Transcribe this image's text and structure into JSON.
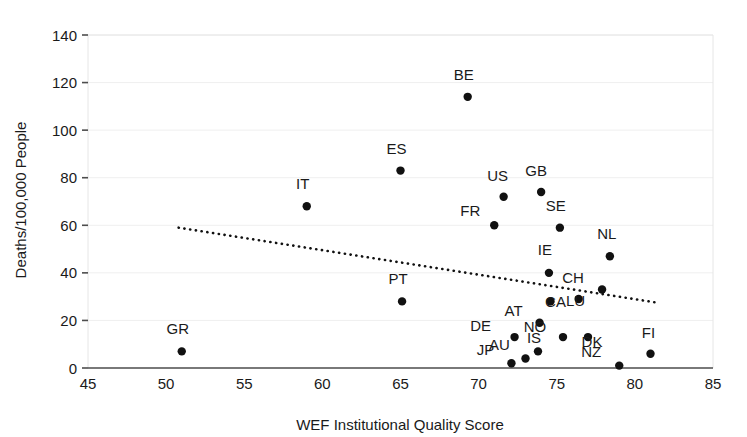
{
  "chart_data": {
    "type": "scatter",
    "title": "",
    "xlabel": "WEF Institutional Quality Score",
    "ylabel": "Deaths/100,000 People",
    "xlim": [
      45,
      85
    ],
    "ylim": [
      0,
      140
    ],
    "xticks": [
      45,
      50,
      55,
      60,
      65,
      70,
      75,
      80,
      85
    ],
    "yticks": [
      0,
      20,
      40,
      60,
      80,
      100,
      120,
      140
    ],
    "grid": "horizontal",
    "legend": "none",
    "marker_color": "#111111",
    "points": [
      {
        "label": "GR",
        "x": 51.0,
        "y": 7,
        "label_dx": -4,
        "label_dy": -17
      },
      {
        "label": "IT",
        "x": 59.0,
        "y": 68,
        "label_dx": -4,
        "label_dy": -17
      },
      {
        "label": "ES",
        "x": 65.0,
        "y": 83,
        "label_dx": -4,
        "label_dy": -17
      },
      {
        "label": "PT",
        "x": 65.1,
        "y": 28,
        "label_dx": -4,
        "label_dy": -17
      },
      {
        "label": "BE",
        "x": 69.3,
        "y": 114,
        "label_dx": -4,
        "label_dy": -17
      },
      {
        "label": "FR",
        "x": 71.0,
        "y": 60,
        "label_dx": -24,
        "label_dy": -9
      },
      {
        "label": "US",
        "x": 71.6,
        "y": 72,
        "label_dx": -6,
        "label_dy": -16
      },
      {
        "label": "JP",
        "x": 72.1,
        "y": 2,
        "label_dx": -26,
        "label_dy": -8
      },
      {
        "label": "DE",
        "x": 72.3,
        "y": 13,
        "label_dx": -34,
        "label_dy": -6
      },
      {
        "label": "AU",
        "x": 73.0,
        "y": 4,
        "label_dx": -26,
        "label_dy": -8
      },
      {
        "label": "IS",
        "x": 73.8,
        "y": 7,
        "label_dx": -4,
        "label_dy": -8
      },
      {
        "label": "AT",
        "x": 73.9,
        "y": 19,
        "label_dx": -26,
        "label_dy": -7
      },
      {
        "label": "GB",
        "x": 74.0,
        "y": 74,
        "label_dx": -5,
        "label_dy": -16
      },
      {
        "label": "IE",
        "x": 74.5,
        "y": 40,
        "label_dx": -4,
        "label_dy": -18
      },
      {
        "label": "CA",
        "x": 74.6,
        "y": 28,
        "label_dx": 5,
        "label_dy": 6
      },
      {
        "label": "SE",
        "x": 75.2,
        "y": 59,
        "label_dx": -4,
        "label_dy": -17
      },
      {
        "label": "NO",
        "x": 75.4,
        "y": 13,
        "label_dx": -28,
        "label_dy": -5
      },
      {
        "label": "LU",
        "x": 76.4,
        "y": 29,
        "label_dx": -3,
        "label_dy": 7
      },
      {
        "label": "DK",
        "x": 77.0,
        "y": 13,
        "label_dx": 4,
        "label_dy": 10
      },
      {
        "label": "CH",
        "x": 77.9,
        "y": 33,
        "label_dx": -29,
        "label_dy": -7
      },
      {
        "label": "NL",
        "x": 78.4,
        "y": 47,
        "label_dx": -3,
        "label_dy": -17
      },
      {
        "label": "NZ",
        "x": 79.0,
        "y": 1,
        "label_dx": -28,
        "label_dy": -9
      },
      {
        "label": "FI",
        "x": 81.0,
        "y": 6,
        "label_dx": -2,
        "label_dy": -16
      }
    ],
    "trendline": {
      "x1": 50.8,
      "y1": 59.0,
      "x2": 81.4,
      "y2": 27.5,
      "style": "dotted"
    }
  }
}
